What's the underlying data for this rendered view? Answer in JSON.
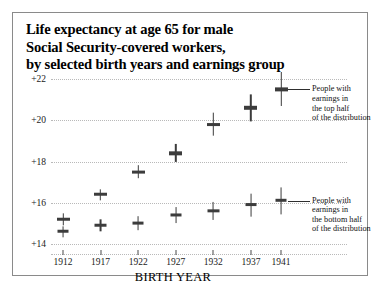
{
  "figure": {
    "title_lines": [
      "Life expectancy at age 65 for male",
      "Social Security-covered workers,",
      "by selected birth years and earnings group"
    ]
  },
  "annotations": {
    "top": {
      "lines": [
        "People with",
        "earnings in",
        "the top half",
        "of the distribution"
      ]
    },
    "bottom": {
      "lines": [
        "People with",
        "earnings in",
        "the bottom half",
        "of the distribution"
      ]
    }
  },
  "chart_data": {
    "type": "scatter",
    "title": "Life expectancy at age 65 for male Social Security-covered workers, by selected birth years and earnings group",
    "xlabel": "BIRTH YEAR",
    "ylabel": "",
    "categories": [
      "1912",
      "1917",
      "1922",
      "1927",
      "1932",
      "1937",
      "1941"
    ],
    "x": [
      1912,
      1917,
      1922,
      1927,
      1932,
      1937,
      1941
    ],
    "ylim": [
      14,
      22
    ],
    "yticks": [
      14,
      16,
      18,
      20,
      22
    ],
    "ytick_labels": [
      "+14",
      "+16",
      "+18",
      "+20",
      "+22"
    ],
    "grid": true,
    "legend": "annotations",
    "series": [
      {
        "name": "People with earnings in the top half of the distribution",
        "values": [
          15.2,
          16.4,
          17.5,
          18.4,
          19.8,
          20.6,
          21.5
        ],
        "errors": [
          0.25,
          0.25,
          0.3,
          0.4,
          0.5,
          0.6,
          0.75
        ]
      },
      {
        "name": "People with earnings in the bottom half of the distribution",
        "values": [
          14.6,
          14.9,
          15.0,
          15.4,
          15.6,
          15.9,
          16.1
        ],
        "errors": [
          0.25,
          0.25,
          0.3,
          0.35,
          0.4,
          0.5,
          0.6
        ]
      }
    ]
  }
}
